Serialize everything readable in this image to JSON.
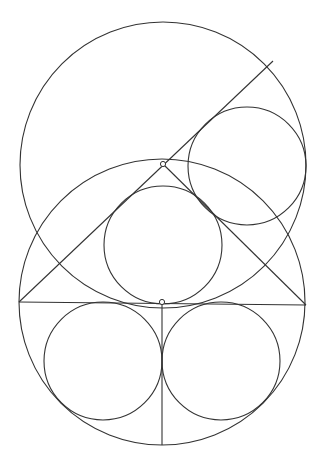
{
  "diagram": {
    "title": "",
    "stroke_color": "#333333",
    "background": "#ffffff",
    "circles": [
      {
        "id": "upper-large-circle",
        "cx": 163,
        "cy": 165,
        "r": 143
      },
      {
        "id": "lower-large-circle",
        "cx": 162,
        "cy": 302,
        "r": 143
      },
      {
        "id": "upper-right-inscribed-circle",
        "cx": 247,
        "cy": 166,
        "r": 59
      },
      {
        "id": "middle-inscribed-circle",
        "cx": 163,
        "cy": 245,
        "r": 59
      },
      {
        "id": "lower-left-inscribed-circle",
        "cx": 103,
        "cy": 361,
        "r": 59
      },
      {
        "id": "lower-right-inscribed-circle",
        "cx": 221,
        "cy": 361,
        "r": 59
      }
    ],
    "lines": [
      {
        "id": "horizontal-diameter",
        "x1": 19,
        "y1": 302,
        "x2": 306,
        "y2": 305
      },
      {
        "id": "vertical-radius",
        "x1": 162,
        "y1": 303,
        "x2": 162,
        "y2": 445
      },
      {
        "id": "long-diagonal",
        "x1": 19,
        "y1": 302,
        "x2": 273,
        "y2": 61
      },
      {
        "id": "right-triangle-side",
        "x1": 163,
        "y1": 164,
        "x2": 306,
        "y2": 305
      }
    ],
    "points": [
      {
        "id": "apex-point",
        "cx": 163,
        "cy": 164
      },
      {
        "id": "center-point",
        "cx": 162,
        "cy": 302
      }
    ]
  }
}
